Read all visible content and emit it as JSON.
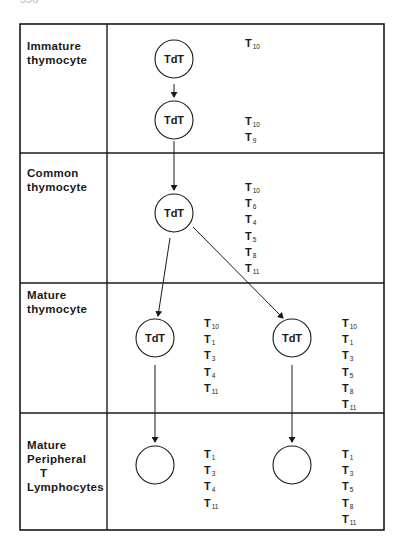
{
  "page_number": "396",
  "stages": [
    {
      "label_lines": [
        "Immature",
        "thymocyte"
      ]
    },
    {
      "label_lines": [
        "Common",
        "thymocyte"
      ]
    },
    {
      "label_lines": [
        "Mature",
        "thymocyte"
      ]
    },
    {
      "label_lines": [
        "Mature",
        "Peripheral",
        "T",
        "Lymphocytes"
      ]
    }
  ],
  "cells": [
    {
      "id": "immature-1",
      "label": "TdT"
    },
    {
      "id": "immature-2",
      "label": "TdT"
    },
    {
      "id": "common",
      "label": "TdT"
    },
    {
      "id": "mature-left",
      "label": "TdT"
    },
    {
      "id": "mature-right",
      "label": "TdT"
    },
    {
      "id": "peripheral-left",
      "label": ""
    },
    {
      "id": "peripheral-right",
      "label": ""
    }
  ],
  "antigen_lists": {
    "immature_1": [
      {
        "base": "T",
        "sub": "10"
      }
    ],
    "immature_2": [
      {
        "base": "T",
        "sub": "10"
      },
      {
        "base": "T",
        "sub": "9"
      }
    ],
    "common": [
      {
        "base": "T",
        "sub": "10"
      },
      {
        "base": "T",
        "sub": "6"
      },
      {
        "base": "T",
        "sub": "4"
      },
      {
        "base": "T",
        "sub": "5"
      },
      {
        "base": "T",
        "sub": "8"
      },
      {
        "base": "T",
        "sub": "11"
      }
    ],
    "mature_left": [
      {
        "base": "T",
        "sub": "10"
      },
      {
        "base": "T",
        "sub": "1"
      },
      {
        "base": "T",
        "sub": "3"
      },
      {
        "base": "T",
        "sub": "4"
      },
      {
        "base": "T",
        "sub": "11"
      }
    ],
    "mature_right": [
      {
        "base": "T",
        "sub": "10"
      },
      {
        "base": "T",
        "sub": "1"
      },
      {
        "base": "T",
        "sub": "3"
      },
      {
        "base": "T",
        "sub": "5"
      },
      {
        "base": "T",
        "sub": "8"
      },
      {
        "base": "T",
        "sub": "11"
      }
    ],
    "peripheral_left": [
      {
        "base": "T",
        "sub": "1"
      },
      {
        "base": "T",
        "sub": "3"
      },
      {
        "base": "T",
        "sub": "4"
      },
      {
        "base": "T",
        "sub": "11"
      }
    ],
    "peripheral_right": [
      {
        "base": "T",
        "sub": "1"
      },
      {
        "base": "T",
        "sub": "3"
      },
      {
        "base": "T",
        "sub": "5"
      },
      {
        "base": "T",
        "sub": "8"
      },
      {
        "base": "T",
        "sub": "11"
      }
    ]
  },
  "arrows": [
    {
      "from": "immature-1",
      "to": "immature-2"
    },
    {
      "from": "immature-2",
      "to": "common"
    },
    {
      "from": "common",
      "to": "mature-left"
    },
    {
      "from": "common",
      "to": "mature-right"
    },
    {
      "from": "mature-left",
      "to": "peripheral-left"
    },
    {
      "from": "mature-right",
      "to": "peripheral-right"
    }
  ]
}
